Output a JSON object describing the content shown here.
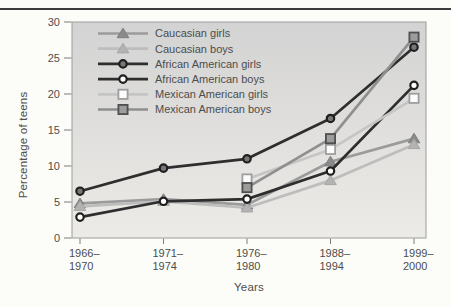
{
  "figure": {
    "top_rule_color": "#3c3c3c",
    "background_color": "#fcfcf8"
  },
  "chart_data": {
    "type": "line",
    "title": "",
    "xlabel": "Years",
    "ylabel": "Percentage of teens",
    "ylim": [
      0,
      30
    ],
    "yticks": [
      0,
      5,
      10,
      15,
      20,
      25,
      30
    ],
    "grid": false,
    "legend_position": "inside-top-left",
    "plot_background_top": "#d3d3d3",
    "plot_background_bottom": "#edebe7",
    "plot_border_color": "#9c9c9c",
    "axis_tick_color": "#7d7d7d",
    "text_color": "#4d4d4d",
    "categories": [
      "1966–1970",
      "1971–1974",
      "1976–1980",
      "1988–1994",
      "1999–2000"
    ],
    "series": [
      {
        "name": "Caucasian girls",
        "marker": "triangle-filled",
        "line_color": "#9b9b9b",
        "marker_fill": "#8a8a8a",
        "marker_stroke": "#7f7f7f",
        "values": [
          4.8,
          5.4,
          4.6,
          10.6,
          13.8
        ]
      },
      {
        "name": "Caucasian boys",
        "marker": "triangle-filled",
        "line_color": "#bdbdbd",
        "marker_fill": "#b3b3b3",
        "marker_stroke": "#a6a6a6",
        "values": [
          4.4,
          5.1,
          4.2,
          8.0,
          13.0
        ]
      },
      {
        "name": "African American girls",
        "marker": "circle-filled",
        "line_color": "#2e2e2e",
        "marker_fill": "#777777",
        "marker_stroke": "#1f1f1f",
        "values": [
          6.5,
          9.7,
          11.0,
          16.6,
          26.5
        ]
      },
      {
        "name": "African American boys",
        "marker": "circle-open",
        "line_color": "#2e2e2e",
        "marker_fill": "#ffffff",
        "marker_stroke": "#1f1f1f",
        "values": [
          2.9,
          5.1,
          5.4,
          9.3,
          21.2
        ]
      },
      {
        "name": "Mexican American girls",
        "marker": "square-open",
        "line_color": "#c5c5c5",
        "marker_fill": "#fcfcfc",
        "marker_stroke": "#9e9e9e",
        "values": [
          null,
          null,
          8.2,
          12.3,
          19.4
        ]
      },
      {
        "name": "Mexican American boys",
        "marker": "square-filled",
        "line_color": "#8f8f8f",
        "marker_fill": "#9c9c9c",
        "marker_stroke": "#4f4f4f",
        "values": [
          null,
          null,
          7.0,
          13.8,
          27.9
        ]
      }
    ]
  }
}
